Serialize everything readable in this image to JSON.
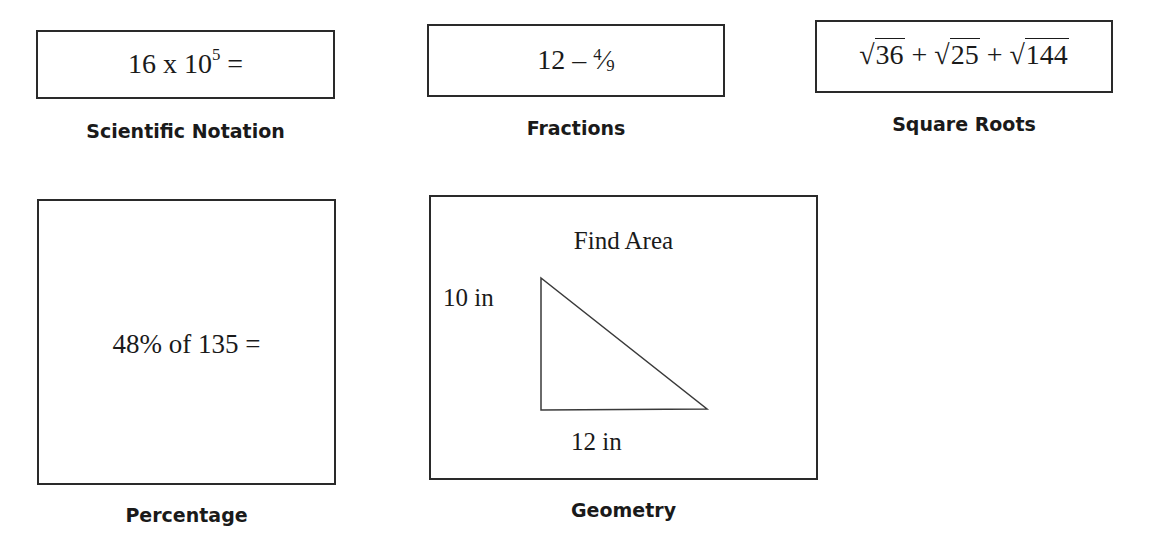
{
  "cards": [
    {
      "id": "scientific-notation",
      "expression": {
        "base": "16 x 10",
        "exponent": "5",
        "suffix": " ="
      },
      "label": "Scientific Notation"
    },
    {
      "id": "fractions",
      "expression": {
        "whole": "12",
        "operator": "–",
        "numerator": "4",
        "slash": "⁄",
        "denominator": "9"
      },
      "label": "Fractions"
    },
    {
      "id": "square-roots",
      "expression": {
        "radicands": [
          "36",
          "25",
          "144"
        ],
        "operator": "+",
        "radical": "√"
      },
      "label": "Square Roots"
    },
    {
      "id": "percentage",
      "expression": {
        "text": "48% of 135 ="
      },
      "label": "Percentage"
    },
    {
      "id": "geometry",
      "expression": {
        "title": "Find Area",
        "height_label": "10 in",
        "base_label": "12 in",
        "shape": "right-triangle"
      },
      "label": "Geometry"
    }
  ]
}
